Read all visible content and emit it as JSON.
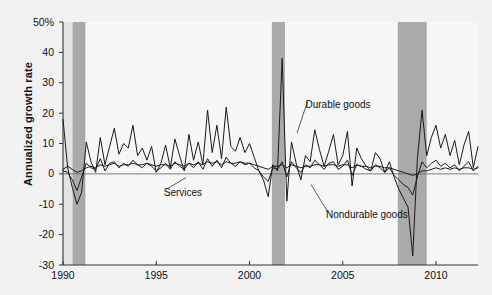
{
  "chart_data": {
    "type": "line",
    "title": "",
    "xlabel": "",
    "ylabel": "Annualized growth rate",
    "xlim": [
      1990,
      2012.25
    ],
    "ylim": [
      -30,
      50
    ],
    "xticks": [
      1990,
      1995,
      2000,
      2005,
      2010
    ],
    "xtick_labels": [
      "1990",
      "1995",
      "2000",
      "2005",
      "2010"
    ],
    "yticks": [
      -30,
      -20,
      -10,
      0,
      10,
      20,
      30,
      40,
      50
    ],
    "ytick_labels": [
      "-30",
      "-20",
      "-10",
      "0",
      "10",
      "20",
      "30",
      "40",
      "50%"
    ],
    "grid": false,
    "legend_position": "inline-annotations",
    "zero_line": 0,
    "annotations": [
      {
        "name": "durable-goods-label",
        "text": "Durable goods",
        "x": 2003.0,
        "y": 22.5,
        "leader_to_x": 2002.55,
        "leader_to_y": 13.5
      },
      {
        "name": "services-label",
        "text": "Services",
        "x": 1995.4,
        "y": -6.5,
        "leader_to_x": 1996.6,
        "leader_to_y": -1.2
      },
      {
        "name": "nondurable-goods-label",
        "text": "Nondurable goods",
        "x": 2004.1,
        "y": -14.0,
        "leader_to_x": 2003.3,
        "leader_to_y": -3.5
      }
    ],
    "shaded_regions": [
      {
        "name": "recession-1990-1991",
        "x0": 1990.5,
        "x1": 1991.2,
        "color": "#aaaaaa"
      },
      {
        "name": "recession-2001",
        "x0": 2001.2,
        "x1": 2001.9,
        "color": "#aaaaaa"
      },
      {
        "name": "recession-2007-2009",
        "x0": 2007.95,
        "x1": 2009.5,
        "color": "#aaaaaa"
      },
      {
        "name": "pre-1990-margin",
        "x0": 1990.0,
        "x1": 1990.5,
        "color": "#e3e3e3"
      }
    ],
    "series": [
      {
        "name": "Durable goods",
        "color": "#1a1a1a",
        "x": [
          1990.0,
          1990.25,
          1990.5,
          1990.75,
          1991.0,
          1991.25,
          1991.5,
          1991.75,
          1992.0,
          1992.25,
          1992.5,
          1992.75,
          1993.0,
          1993.25,
          1993.5,
          1993.75,
          1994.0,
          1994.25,
          1994.5,
          1994.75,
          1995.0,
          1995.25,
          1995.5,
          1995.75,
          1996.0,
          1996.25,
          1996.5,
          1996.75,
          1997.0,
          1997.25,
          1997.5,
          1997.75,
          1998.0,
          1998.25,
          1998.5,
          1998.75,
          1999.0,
          1999.25,
          1999.5,
          1999.75,
          2000.0,
          2000.25,
          2000.5,
          2000.75,
          2001.0,
          2001.25,
          2001.5,
          2001.75,
          2002.0,
          2002.25,
          2002.5,
          2002.75,
          2003.0,
          2003.25,
          2003.5,
          2003.75,
          2004.0,
          2004.25,
          2004.5,
          2004.75,
          2005.0,
          2005.25,
          2005.5,
          2005.75,
          2006.0,
          2006.25,
          2006.5,
          2006.75,
          2007.0,
          2007.25,
          2007.5,
          2007.75,
          2008.0,
          2008.25,
          2008.5,
          2008.75,
          2009.0,
          2009.25,
          2009.5,
          2009.75,
          2010.0,
          2010.25,
          2010.5,
          2010.75,
          2011.0,
          2011.25,
          2011.5,
          2011.75,
          2012.0,
          2012.25
        ],
        "values": [
          18.0,
          2.0,
          -4.5,
          -10.0,
          -6.0,
          10.5,
          4.0,
          0.5,
          12.0,
          3.0,
          9.0,
          15.0,
          6.5,
          10.0,
          8.5,
          16.0,
          6.0,
          8.5,
          4.5,
          9.0,
          0.5,
          3.5,
          9.5,
          2.0,
          11.5,
          6.0,
          1.0,
          13.0,
          4.5,
          10.5,
          3.0,
          21.0,
          7.0,
          16.0,
          5.0,
          22.0,
          9.0,
          7.5,
          12.0,
          7.0,
          10.0,
          5.5,
          1.0,
          -2.0,
          -7.5,
          3.0,
          1.0,
          38.0,
          -9.0,
          10.5,
          3.5,
          -2.0,
          6.0,
          4.0,
          14.5,
          8.0,
          2.5,
          7.5,
          13.0,
          3.0,
          6.0,
          14.0,
          -4.0,
          8.5,
          5.0,
          2.5,
          1.0,
          7.0,
          5.0,
          0.5,
          4.0,
          -1.0,
          -5.0,
          -8.0,
          -11.0,
          -27.0,
          5.0,
          21.0,
          6.0,
          12.0,
          16.0,
          8.5,
          13.0,
          6.0,
          11.0,
          3.0,
          9.5,
          14.0,
          2.0,
          9.0
        ]
      },
      {
        "name": "Nondurable goods",
        "color": "#1a1a1a",
        "x": [
          1990.0,
          1990.25,
          1990.5,
          1990.75,
          1991.0,
          1991.25,
          1991.5,
          1991.75,
          1992.0,
          1992.25,
          1992.5,
          1992.75,
          1993.0,
          1993.25,
          1993.5,
          1993.75,
          1994.0,
          1994.25,
          1994.5,
          1994.75,
          1995.0,
          1995.25,
          1995.5,
          1995.75,
          1996.0,
          1996.25,
          1996.5,
          1996.75,
          1997.0,
          1997.25,
          1997.5,
          1997.75,
          1998.0,
          1998.25,
          1998.5,
          1998.75,
          1999.0,
          1999.25,
          1999.5,
          1999.75,
          2000.0,
          2000.25,
          2000.5,
          2000.75,
          2001.0,
          2001.25,
          2001.5,
          2001.75,
          2002.0,
          2002.25,
          2002.5,
          2002.75,
          2003.0,
          2003.25,
          2003.5,
          2003.75,
          2004.0,
          2004.25,
          2004.5,
          2004.75,
          2005.0,
          2005.25,
          2005.5,
          2005.75,
          2006.0,
          2006.25,
          2006.5,
          2006.75,
          2007.0,
          2007.25,
          2007.5,
          2007.75,
          2008.0,
          2008.25,
          2008.5,
          2008.75,
          2009.0,
          2009.25,
          2009.5,
          2009.75,
          2010.0,
          2010.25,
          2010.5,
          2010.75,
          2011.0,
          2011.25,
          2011.5,
          2011.75,
          2012.0,
          2012.25
        ],
        "values": [
          1.0,
          0.5,
          -2.0,
          -5.5,
          -1.0,
          3.5,
          2.0,
          1.5,
          5.0,
          1.0,
          3.5,
          4.0,
          2.0,
          3.5,
          2.5,
          4.5,
          3.0,
          2.0,
          3.5,
          2.5,
          1.0,
          2.0,
          3.5,
          1.5,
          4.0,
          2.5,
          1.5,
          3.5,
          2.0,
          4.0,
          1.5,
          5.0,
          2.5,
          4.5,
          2.0,
          5.5,
          3.5,
          2.5,
          4.0,
          3.0,
          3.5,
          2.0,
          1.0,
          -1.0,
          -2.5,
          2.0,
          1.5,
          4.0,
          -1.0,
          4.0,
          2.0,
          0.5,
          3.0,
          2.0,
          4.5,
          3.0,
          1.5,
          3.5,
          4.0,
          1.5,
          2.5,
          4.5,
          -0.5,
          3.0,
          2.5,
          1.5,
          1.0,
          3.0,
          2.0,
          0.5,
          2.0,
          -0.5,
          -2.0,
          -3.5,
          -4.5,
          -7.0,
          -1.0,
          4.0,
          2.0,
          3.5,
          4.5,
          2.5,
          3.5,
          2.0,
          3.0,
          1.0,
          2.5,
          4.0,
          1.0,
          2.5
        ]
      },
      {
        "name": "Services",
        "color": "#1a1a1a",
        "x": [
          1990.0,
          1990.25,
          1990.5,
          1990.75,
          1991.0,
          1991.25,
          1991.5,
          1991.75,
          1992.0,
          1992.25,
          1992.5,
          1992.75,
          1993.0,
          1993.25,
          1993.5,
          1993.75,
          1994.0,
          1994.25,
          1994.5,
          1994.75,
          1995.0,
          1995.25,
          1995.5,
          1995.75,
          1996.0,
          1996.25,
          1996.5,
          1996.75,
          1997.0,
          1997.25,
          1997.5,
          1997.75,
          1998.0,
          1998.25,
          1998.5,
          1998.75,
          1999.0,
          1999.25,
          1999.5,
          1999.75,
          2000.0,
          2000.25,
          2000.5,
          2000.75,
          2001.0,
          2001.25,
          2001.5,
          2001.75,
          2002.0,
          2002.25,
          2002.5,
          2002.75,
          2003.0,
          2003.25,
          2003.5,
          2003.75,
          2004.0,
          2004.25,
          2004.5,
          2004.75,
          2005.0,
          2005.25,
          2005.5,
          2005.75,
          2006.0,
          2006.25,
          2006.5,
          2006.75,
          2007.0,
          2007.25,
          2007.5,
          2007.75,
          2008.0,
          2008.25,
          2008.5,
          2008.75,
          2009.0,
          2009.25,
          2009.5,
          2009.75,
          2010.0,
          2010.25,
          2010.5,
          2010.75,
          2011.0,
          2011.25,
          2011.5,
          2011.75,
          2012.0,
          2012.25
        ],
        "values": [
          1.5,
          2.5,
          1.5,
          0.5,
          1.0,
          2.0,
          2.5,
          2.0,
          3.0,
          2.5,
          3.0,
          3.5,
          2.5,
          3.0,
          3.0,
          3.5,
          3.0,
          3.0,
          3.5,
          3.0,
          2.5,
          3.0,
          3.0,
          2.5,
          3.5,
          3.0,
          2.5,
          3.5,
          3.0,
          3.5,
          3.0,
          4.0,
          3.5,
          4.0,
          3.0,
          4.0,
          3.5,
          3.5,
          4.0,
          3.5,
          3.5,
          3.0,
          2.5,
          2.0,
          1.5,
          2.5,
          2.5,
          3.0,
          2.0,
          3.0,
          2.5,
          2.0,
          2.5,
          2.5,
          3.0,
          3.0,
          2.5,
          3.0,
          3.0,
          2.5,
          3.0,
          3.0,
          2.0,
          3.0,
          2.5,
          2.5,
          2.0,
          2.5,
          2.5,
          2.0,
          2.0,
          1.5,
          1.0,
          0.5,
          0.0,
          -0.5,
          0.0,
          1.0,
          1.0,
          1.5,
          2.0,
          1.5,
          2.0,
          1.5,
          2.0,
          1.5,
          2.0,
          2.0,
          1.5,
          2.0
        ]
      }
    ]
  }
}
